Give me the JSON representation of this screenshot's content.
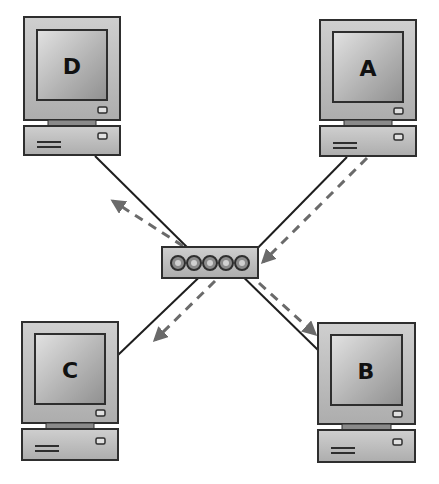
{
  "diagram": {
    "type": "network-switch-broadcast",
    "colors": {
      "background": "#ffffff",
      "device_fill": "#bdbdbd",
      "screen_fill_light": "#d8d8d8",
      "screen_fill_dark": "#9a9a9a",
      "outline": "#3a3a3a",
      "cable": "#1e1e1e",
      "traffic_arrow": "#6a6a6a"
    },
    "computers": [
      {
        "id": "D",
        "label": "D",
        "x": 24,
        "y": 17
      },
      {
        "id": "A",
        "label": "A",
        "x": 320,
        "y": 20
      },
      {
        "id": "C",
        "label": "C",
        "x": 22,
        "y": 322
      },
      {
        "id": "B",
        "label": "B",
        "x": 318,
        "y": 323
      }
    ],
    "switch": {
      "x": 162,
      "y": 247,
      "width": 96,
      "height": 31,
      "port_count": 5
    },
    "connections": [
      {
        "from": "D",
        "to": "switch",
        "kind": "cable"
      },
      {
        "from": "A",
        "to": "switch",
        "kind": "cable"
      },
      {
        "from": "C",
        "to": "switch",
        "kind": "cable"
      },
      {
        "from": "B",
        "to": "switch",
        "kind": "cable"
      }
    ],
    "traffic": [
      {
        "from": "A",
        "to": "switch",
        "style": "dashed-arrow"
      },
      {
        "from": "switch",
        "to": "D",
        "style": "dashed-arrow"
      },
      {
        "from": "switch",
        "to": "C",
        "style": "dashed-arrow"
      },
      {
        "from": "switch",
        "to": "B",
        "style": "dashed-arrow"
      }
    ]
  }
}
